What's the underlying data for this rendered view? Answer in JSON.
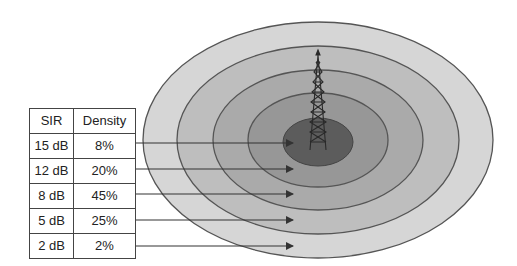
{
  "diagram": {
    "center": {
      "x": 318,
      "y": 140
    },
    "rings": [
      {
        "name": "zone-2db",
        "rx": 175,
        "ry": 118,
        "fill": "#d6d6d6"
      },
      {
        "name": "zone-5db",
        "rx": 141,
        "ry": 94,
        "fill": "#bebebe"
      },
      {
        "name": "zone-8db",
        "rx": 105,
        "ry": 70,
        "fill": "#aaaaaa"
      },
      {
        "name": "zone-12db",
        "rx": 70,
        "ry": 47,
        "fill": "#979797"
      },
      {
        "name": "zone-15db",
        "rx": 35,
        "ry": 24,
        "fill": "#5c5c5c"
      }
    ],
    "ring_stroke": "#555555",
    "tower_icon": "cell-tower-icon"
  },
  "table": {
    "headers": [
      "SIR",
      "Density"
    ],
    "rows": [
      {
        "sir": "15 dB",
        "density": "8%"
      },
      {
        "sir": "12 dB",
        "density": "20%"
      },
      {
        "sir": "8 dB",
        "density": "45%"
      },
      {
        "sir": "5 dB",
        "density": "25%"
      },
      {
        "sir": "2 dB",
        "density": "2%"
      }
    ]
  },
  "arrows": {
    "y_levels": [
      143,
      169,
      194,
      220,
      246
    ],
    "x_start": 135,
    "x_tip": 293
  }
}
